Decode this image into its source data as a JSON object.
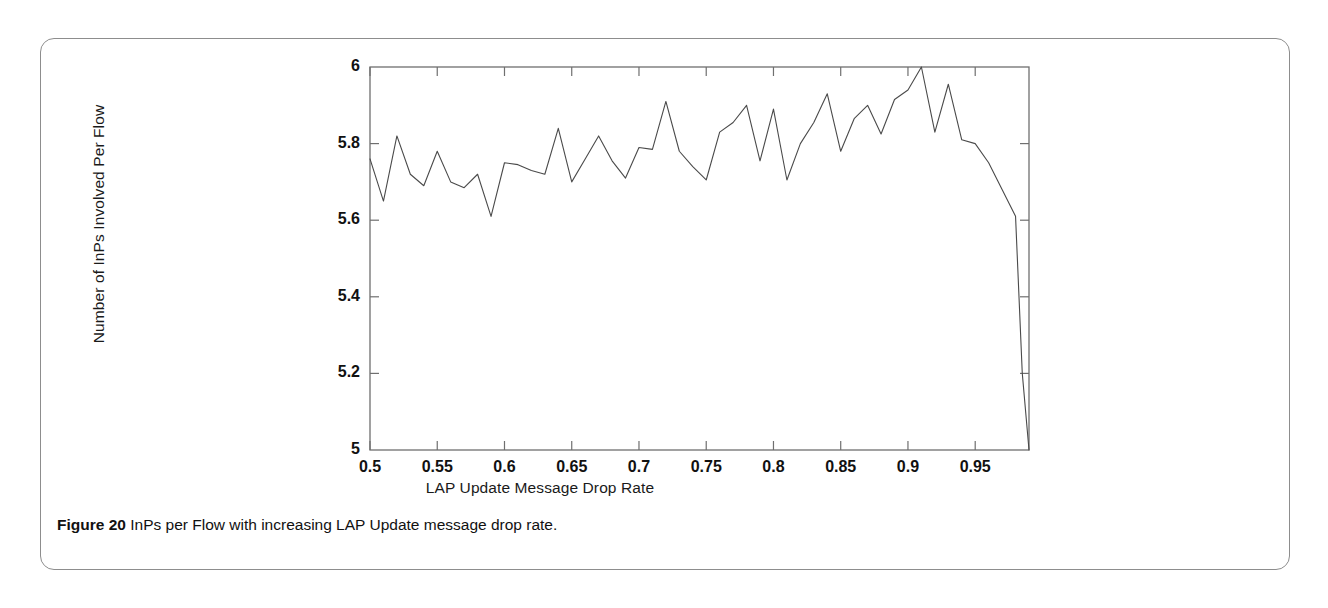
{
  "figure": {
    "caption_label": "Figure 20",
    "caption_text": "InPs per Flow with increasing LAP Update message drop rate.",
    "border_color": "#8d8d8d",
    "background_color": "#ffffff"
  },
  "chart_data": {
    "type": "line",
    "title": "",
    "subtitle": "",
    "xlabel": "LAP Update Message Drop Rate",
    "ylabel": "Number of InPs Involved Per Flow",
    "xlim": [
      0.5,
      0.99
    ],
    "ylim": [
      5,
      6
    ],
    "xticks": [
      0.5,
      0.55,
      0.6,
      0.65,
      0.7,
      0.75,
      0.8,
      0.85,
      0.9,
      0.95
    ],
    "xtick_labels": [
      "0.5",
      "0.55",
      "0.6",
      "0.65",
      "0.7",
      "0.75",
      "0.8",
      "0.85",
      "0.9",
      "0.95"
    ],
    "yticks": [
      5,
      5.2,
      5.4,
      5.6,
      5.8,
      6
    ],
    "ytick_labels": [
      "5",
      "5.2",
      "5.4",
      "5.6",
      "5.8",
      "6"
    ],
    "grid": false,
    "legend": null,
    "line_color": "#4a4a4a",
    "line_width": 1.1,
    "series": [
      {
        "name": "InPs per Flow",
        "x": [
          0.5,
          0.51,
          0.52,
          0.53,
          0.54,
          0.55,
          0.56,
          0.57,
          0.58,
          0.59,
          0.6,
          0.61,
          0.62,
          0.63,
          0.64,
          0.65,
          0.66,
          0.67,
          0.68,
          0.69,
          0.7,
          0.71,
          0.72,
          0.73,
          0.74,
          0.75,
          0.76,
          0.77,
          0.78,
          0.79,
          0.8,
          0.81,
          0.82,
          0.83,
          0.84,
          0.85,
          0.86,
          0.87,
          0.88,
          0.89,
          0.9,
          0.91,
          0.92,
          0.93,
          0.94,
          0.95,
          0.96,
          0.97,
          0.98,
          0.985,
          0.99
        ],
        "values": [
          5.76,
          5.65,
          5.82,
          5.72,
          5.69,
          5.78,
          5.7,
          5.685,
          5.72,
          5.61,
          5.75,
          5.745,
          5.73,
          5.72,
          5.84,
          5.7,
          5.76,
          5.82,
          5.755,
          5.71,
          5.79,
          5.785,
          5.91,
          5.78,
          5.74,
          5.705,
          5.83,
          5.855,
          5.9,
          5.755,
          5.89,
          5.705,
          5.8,
          5.855,
          5.93,
          5.78,
          5.865,
          5.9,
          5.825,
          5.915,
          5.94,
          6.0,
          5.83,
          5.955,
          5.81,
          5.8,
          5.75,
          5.68,
          5.61,
          5.2,
          5.0
        ]
      }
    ]
  }
}
